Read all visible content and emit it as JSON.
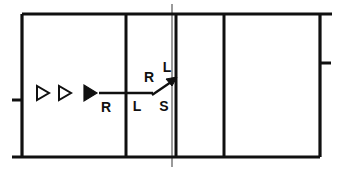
{
  "diagram": {
    "colors": {
      "line": "#101010",
      "thin_line": "#6f6f6f",
      "background": "#ffffff"
    },
    "frame": {
      "left": 22,
      "top": 14,
      "right": 320,
      "bottom": 157,
      "stroke_width": 3.2,
      "top_overhang_right": 12,
      "bottom_overhang_left": 10
    },
    "dividers": [
      {
        "name": "divider-1",
        "x": 126,
        "style": "thick"
      },
      {
        "name": "divider-2",
        "x": 176,
        "style": "thick"
      },
      {
        "name": "divider-3",
        "x": 224,
        "style": "thick"
      }
    ],
    "thin_marker": {
      "name": "center-marker",
      "x": 172,
      "top": 4,
      "bottom": 167,
      "stroke_width": 1.4
    },
    "ticks": [
      {
        "name": "tick-left",
        "x1": 12,
        "x2": 22,
        "y": 100
      },
      {
        "name": "tick-right",
        "x1": 320,
        "x2": 331,
        "y": 63
      }
    ],
    "triangles": [
      {
        "name": "triangle-hollow-1",
        "x": 42,
        "y": 93,
        "size": 11,
        "filled": false
      },
      {
        "name": "triangle-hollow-2",
        "x": 64,
        "y": 93,
        "size": 11,
        "filled": false
      },
      {
        "name": "triangle-filled",
        "x": 88,
        "y": 93,
        "size": 11,
        "filled": true
      }
    ],
    "route_line": {
      "name": "main-route-line",
      "x1": 100,
      "y1": 93,
      "x2": 152,
      "y2": 93,
      "stroke_width": 2.2
    },
    "branch_arrow": {
      "name": "branch-arrow",
      "x1": 152,
      "y1": 94,
      "x2": 175,
      "y2": 79,
      "stroke_width": 2.2,
      "head_size": 6
    },
    "labels": [
      {
        "name": "label-route-R",
        "text": "R",
        "x": 106,
        "y": 108
      },
      {
        "name": "label-branch-R",
        "text": "R",
        "x": 149,
        "y": 78
      },
      {
        "name": "label-branch-L",
        "text": "L",
        "x": 167,
        "y": 68
      },
      {
        "name": "label-route-L",
        "text": "L",
        "x": 137,
        "y": 107
      },
      {
        "name": "label-route-S",
        "text": "S",
        "x": 164,
        "y": 107
      }
    ]
  }
}
